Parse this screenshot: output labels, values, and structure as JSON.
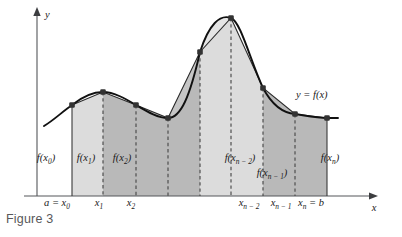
{
  "figure": {
    "caption": "Figure 3",
    "axes": {
      "x_label": "x",
      "y_label": "y"
    },
    "curve_label": "y = f(x)",
    "colors": {
      "curve": "#1a1a1a",
      "axis": "#55565a",
      "strip_light": "#dcdcdc",
      "strip_dark": "#b9b9b9",
      "dash": "#4a4a4a",
      "vertex": "#3a3a3a",
      "caption_text": "#58585a",
      "background": "#ffffff"
    },
    "value_labels": [
      {
        "id": "fx0",
        "base": "f(x",
        "sub": "0",
        "tail": ")",
        "x": 46,
        "y": 161
      },
      {
        "id": "fx1",
        "base": "f(x",
        "sub": "1",
        "tail": ")",
        "x": 86,
        "y": 161
      },
      {
        "id": "fx2",
        "base": "f(x",
        "sub": "2",
        "tail": ")",
        "x": 122,
        "y": 161
      },
      {
        "id": "fxn-2",
        "base": "f(x",
        "sub": "n − 2",
        "tail": ")",
        "x": 240,
        "y": 161
      },
      {
        "id": "fxn-1",
        "base": "f(x",
        "sub": "n − 1",
        "tail": ")",
        "x": 272,
        "y": 176
      },
      {
        "id": "fxn",
        "base": "f(x",
        "sub": "n",
        "tail": ")",
        "x": 330,
        "y": 161
      }
    ],
    "tick_labels": [
      {
        "id": "x0",
        "pre": "a = x",
        "sub": "0",
        "x": 57,
        "y": 206
      },
      {
        "id": "x1",
        "pre": "x",
        "sub": "1",
        "x": 99,
        "y": 206
      },
      {
        "id": "x2",
        "pre": "x",
        "sub": "2",
        "x": 131,
        "y": 206
      },
      {
        "id": "xn2",
        "pre": "x",
        "sub": "n − 2",
        "x": 249,
        "y": 206
      },
      {
        "id": "xn1",
        "pre": "x",
        "sub": "n − 1",
        "x": 281,
        "y": 206
      },
      {
        "id": "xnb",
        "pre": "x",
        "sub": "n",
        "post": " = b",
        "x": 311,
        "y": 206
      }
    ],
    "chart_data": {
      "type": "area",
      "title": "Figure 3",
      "xlabel": "x",
      "ylabel": "y",
      "description": "Trapezoidal Rule approximation: curve y = f(x) over [a, b] partitioned into n subintervals with trapezoids drawn between consecutive partition points.",
      "partition_points_px": [
        72,
        103,
        136,
        168,
        200,
        231,
        263,
        295,
        327
      ],
      "partition_names": [
        "a = x0",
        "x1",
        "x2",
        "",
        "",
        "",
        "xn-2",
        "xn-1",
        "xn = b"
      ],
      "function_values_px_y": [
        105,
        92,
        105,
        118,
        52,
        18,
        88,
        114,
        118
      ],
      "baseline_px_y": 196,
      "axis_origin_px": [
        37,
        196
      ],
      "x_axis_end_px": 378,
      "y_axis_top_px": 10,
      "curve_tail_left_px": [
        44,
        126
      ],
      "strip_shading": [
        "light",
        "dark",
        "dark",
        "dark",
        "light",
        "light",
        "dark",
        "dark"
      ],
      "grid": false,
      "legend": "y = f(x)"
    }
  }
}
